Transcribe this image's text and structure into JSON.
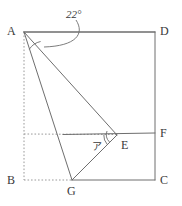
{
  "figure": {
    "width": 182,
    "height": 206,
    "stroke_color": "#6e6e6e",
    "dotted_color": "#9a9a9a",
    "text_color": "#3a3a3a",
    "background": "#ffffff"
  },
  "vertices": [
    {
      "id": "A",
      "label": "A",
      "x": 24,
      "y": 32,
      "label_x": 7,
      "label_y": 25
    },
    {
      "id": "D",
      "label": "D",
      "x": 155,
      "y": 32,
      "label_x": 160,
      "label_y": 25
    },
    {
      "id": "B",
      "label": "B",
      "x": 24,
      "y": 180,
      "label_x": 7,
      "label_y": 174
    },
    {
      "id": "C",
      "label": "C",
      "x": 155,
      "y": 180,
      "label_x": 160,
      "label_y": 174
    },
    {
      "id": "F",
      "label": "F",
      "x": 155,
      "y": 133,
      "label_x": 160,
      "label_y": 127
    },
    {
      "id": "E",
      "label": "E",
      "x": 117,
      "y": 135,
      "label_x": 121,
      "label_y": 139
    },
    {
      "id": "G",
      "label": "G",
      "x": 72,
      "y": 180,
      "label_x": 67,
      "label_y": 185
    }
  ],
  "solid_segments": [
    {
      "name": "segment-AD",
      "from": "A",
      "to": "D"
    },
    {
      "name": "segment-DC",
      "from": "D",
      "to": "C"
    },
    {
      "name": "segment-CG",
      "from": "C",
      "to": "G"
    },
    {
      "name": "segment-GA",
      "from": "G",
      "to": "A"
    },
    {
      "name": "segment-AE",
      "from": "A",
      "to": "E"
    },
    {
      "name": "segment-EG",
      "from": "E",
      "to": "G"
    },
    {
      "name": "segment-EF",
      "from": "E",
      "to": "F"
    }
  ],
  "dotted_segments": [
    {
      "name": "dotted-AB",
      "from": "A",
      "to": "B"
    },
    {
      "name": "dotted-BG",
      "from": "B",
      "to": "G"
    },
    {
      "name": "dotted-EF-extension-left",
      "x1": 24,
      "y1": 134,
      "x2": 117,
      "y2": 135
    }
  ],
  "angles": [
    {
      "name": "angle-at-A",
      "vertex": "A",
      "label": "22°",
      "label_x": 66,
      "label_y": 9,
      "arc_radius": 18,
      "leader": true
    },
    {
      "name": "angle-at-E",
      "vertex": "E",
      "label": "ア",
      "label_x": 92,
      "label_y": 142,
      "arc_radius": 14,
      "leader": false
    }
  ],
  "labels": {
    "angle_a_value": "22°",
    "unknown_angle": "ア"
  }
}
